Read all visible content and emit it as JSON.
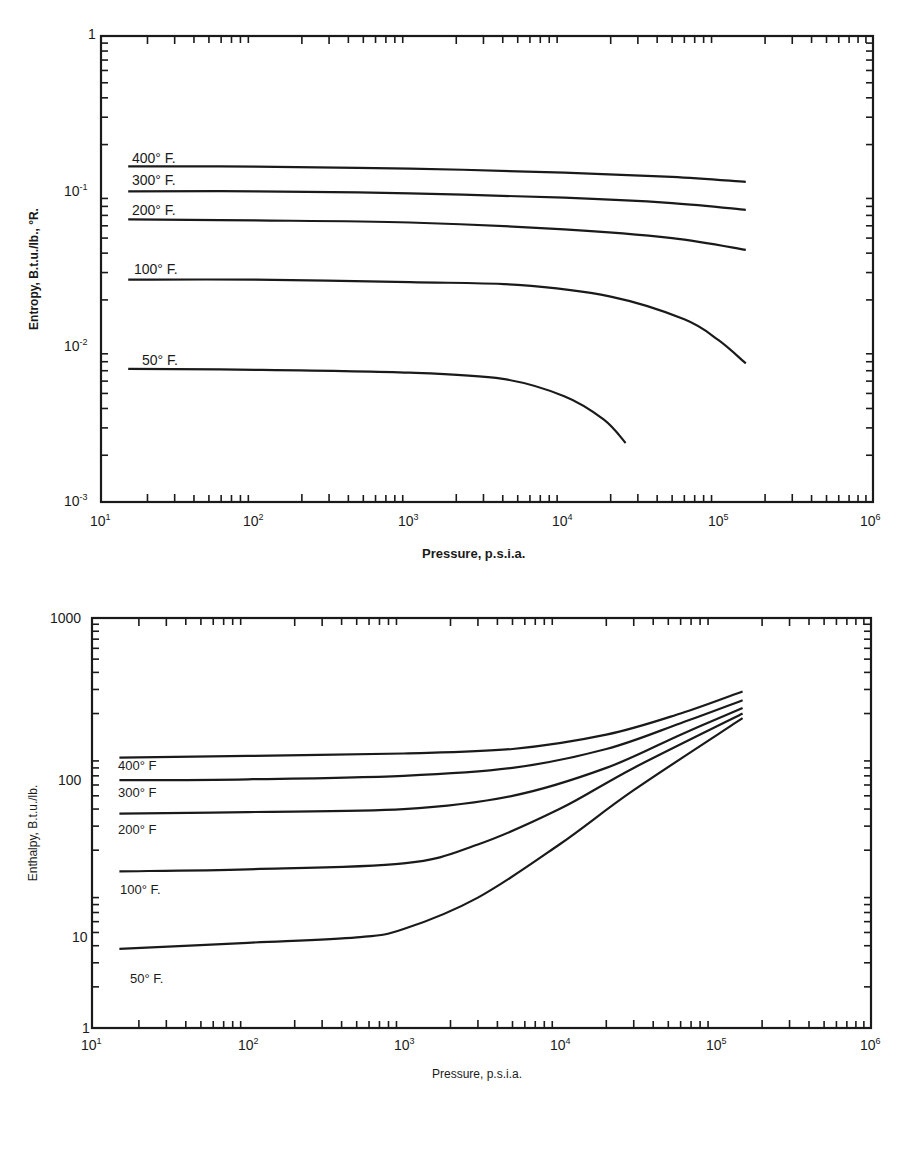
{
  "chart_data": [
    {
      "type": "line",
      "title": "",
      "xlabel": "Pressure, p.s.i.a.",
      "ylabel": "Entropy, B.t.u./lb., °R.",
      "xscale": "log",
      "yscale": "log",
      "xlim": [
        10,
        1000000
      ],
      "ylim": [
        0.001,
        1
      ],
      "grid": false,
      "legend": "inline labels at left of each curve",
      "data_provenance": "estimated by eye from zoomed screenshot; endpoints and curve shapes approximated, not digitized point-by-point",
      "x_ticks": [
        "10^1",
        "10^2",
        "10^3",
        "10^4",
        "10^5",
        "10^6"
      ],
      "y_ticks": [
        "10^-3",
        "10^-2",
        "10^-1",
        "1"
      ],
      "series": [
        {
          "name": "400° F.",
          "x": [
            15,
            100,
            1000,
            10000,
            50000,
            150000
          ],
          "y": [
            0.145,
            0.144,
            0.14,
            0.132,
            0.124,
            0.115
          ]
        },
        {
          "name": "300° F.",
          "x": [
            15,
            100,
            1000,
            10000,
            50000,
            150000
          ],
          "y": [
            0.1,
            0.1,
            0.097,
            0.091,
            0.084,
            0.076
          ]
        },
        {
          "name": "200° F.",
          "x": [
            15,
            100,
            1000,
            10000,
            50000,
            150000
          ],
          "y": [
            0.066,
            0.065,
            0.063,
            0.057,
            0.05,
            0.042
          ]
        },
        {
          "name": "100° F.",
          "x": [
            15,
            100,
            1000,
            5000,
            20000,
            60000,
            100000,
            150000
          ],
          "y": [
            0.027,
            0.027,
            0.026,
            0.025,
            0.021,
            0.015,
            0.011,
            0.0078
          ]
        },
        {
          "name": "50° F.",
          "x": [
            15,
            100,
            1000,
            4000,
            10000,
            18000,
            25000
          ],
          "y": [
            0.0072,
            0.0071,
            0.0068,
            0.0062,
            0.0048,
            0.0034,
            0.0024
          ]
        }
      ]
    },
    {
      "type": "line",
      "title": "",
      "xlabel": "Pressure, p.s.i.a.",
      "ylabel": "Enthalpy, B.t.u./lb.",
      "xscale": "log",
      "yscale": "log",
      "xlim": [
        10,
        1000000
      ],
      "ylim": [
        1,
        1000
      ],
      "grid": false,
      "legend": "inline labels at left of each curve",
      "data_provenance": "estimated by eye from zoomed screenshot; endpoints and curve shapes approximated, not digitized point-by-point",
      "x_ticks": [
        "10^1",
        "10^2",
        "10^3",
        "10^4",
        "10^5",
        "10^6"
      ],
      "y_ticks": [
        "1",
        "10",
        "100",
        "1000"
      ],
      "series": [
        {
          "name": "400° F",
          "x": [
            15,
            100,
            1000,
            5000,
            20000,
            60000,
            150000
          ],
          "y": [
            95,
            98,
            102,
            110,
            140,
            200,
            290
          ]
        },
        {
          "name": "300° F",
          "x": [
            15,
            100,
            1000,
            5000,
            20000,
            60000,
            150000
          ],
          "y": [
            65,
            66,
            70,
            80,
            110,
            170,
            250
          ]
        },
        {
          "name": "200° F",
          "x": [
            15,
            100,
            1000,
            5000,
            20000,
            60000,
            150000
          ],
          "y": [
            37,
            38,
            40,
            50,
            80,
            140,
            220
          ]
        },
        {
          "name": "100° F.",
          "x": [
            15,
            100,
            1000,
            3000,
            10000,
            30000,
            150000
          ],
          "y": [
            14,
            14.5,
            16,
            22,
            40,
            80,
            200
          ]
        },
        {
          "name": "50° F.",
          "x": [
            15,
            100,
            500,
            1000,
            3000,
            10000,
            30000,
            150000
          ],
          "y": [
            3.8,
            4.2,
            4.6,
            5.3,
            9,
            22,
            55,
            185
          ]
        }
      ]
    }
  ],
  "top": {
    "ylabel": "Entropy, B.t.u./lb., °R.",
    "xlabel": "Pressure, p.s.i.a.",
    "y_tick_labels": {
      "t1": "1",
      "tm1": "10",
      "tm1_exp": "-1",
      "tm2": "10",
      "tm2_exp": "-2",
      "tm3": "10",
      "tm3_exp": "-3"
    },
    "x_tick_labels": [
      {
        "base": "10",
        "exp": "1"
      },
      {
        "base": "10",
        "exp": "2"
      },
      {
        "base": "10",
        "exp": "3"
      },
      {
        "base": "10",
        "exp": "4"
      },
      {
        "base": "10",
        "exp": "5"
      },
      {
        "base": "10",
        "exp": "6"
      }
    ],
    "series_labels": [
      "400° F.",
      "300° F.",
      "200° F.",
      "100° F.",
      "50° F."
    ]
  },
  "bottom": {
    "ylabel": "Enthalpy, B.t.u./lb.",
    "xlabel": "Pressure, p.s.i.a.",
    "y_tick_labels": {
      "t1000": "1000",
      "t100": "100",
      "t10": "10",
      "t1": "1"
    },
    "x_tick_labels": [
      {
        "base": "10",
        "exp": "1"
      },
      {
        "base": "10",
        "exp": "2"
      },
      {
        "base": "10",
        "exp": "3"
      },
      {
        "base": "10",
        "exp": "4"
      },
      {
        "base": "10",
        "exp": "5"
      },
      {
        "base": "10",
        "exp": "6"
      }
    ],
    "series_labels": [
      "400° F",
      "300° F",
      "200° F",
      "100° F.",
      "50° F."
    ]
  },
  "colors": {
    "ink": "#1a1a1a",
    "background": "#ffffff"
  }
}
